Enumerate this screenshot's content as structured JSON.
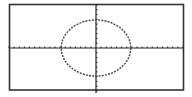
{
  "chart_data": {
    "type": "line",
    "title": "",
    "xlabel": "",
    "ylabel": "",
    "xlim": [
      -17,
      17
    ],
    "ylim": [
      -9,
      9
    ],
    "xtick_step": 1,
    "ytick_step": 1,
    "grid": false,
    "series": [
      {
        "name": "conic",
        "shape": "ellipse",
        "center": [
          0,
          0
        ],
        "x_radius": 7,
        "y_radius": 6,
        "style": "dotted"
      }
    ]
  },
  "colors": {
    "frame": "#333333",
    "axes": "#222222",
    "curve": "#444444",
    "background": "#ffffff"
  }
}
